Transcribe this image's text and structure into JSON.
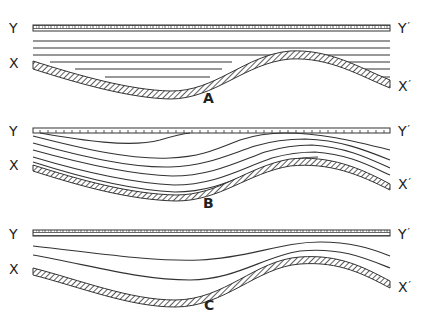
{
  "diagram": {
    "panels": [
      {
        "id": "A",
        "label": "A",
        "top_left_label": "Y",
        "top_right_label": "Y",
        "bottom_left_label": "X",
        "bottom_right_label": "X",
        "prime": "′",
        "description": "Horizontal layers truncated against an undulating basement (onlap)",
        "layer_count": 6
      },
      {
        "id": "B",
        "label": "B",
        "top_left_label": "Y",
        "top_right_label": "Y",
        "bottom_left_label": "X",
        "bottom_right_label": "X",
        "prime": "′",
        "description": "Layers parallel to basement, truncated by the flat top surface",
        "layer_count": 5
      },
      {
        "id": "C",
        "label": "C",
        "top_left_label": "Y",
        "top_right_label": "Y",
        "bottom_left_label": "X",
        "bottom_right_label": "X",
        "prime": "′",
        "description": "Layers progressively flattening upward from basement to top surface",
        "layer_count": 2
      }
    ]
  }
}
